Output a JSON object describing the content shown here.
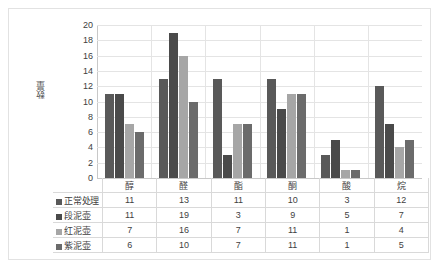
{
  "chart_data": {
    "type": "bar",
    "title": "",
    "xlabel": "",
    "ylabel": "数量",
    "ylim": [
      0,
      20
    ],
    "ytick_step": 2,
    "yticks": [
      20,
      18,
      16,
      14,
      12,
      10,
      8,
      6,
      4,
      2,
      0
    ],
    "grid": true,
    "legend_position": "table-left",
    "categories": [
      "醇",
      "醛",
      "酯",
      "酮",
      "酸",
      "烷"
    ],
    "series": [
      {
        "name": "正常处理",
        "color": "#595959",
        "values": [
          11,
          13,
          11,
          10,
          3,
          12
        ],
        "plotted_values": [
          11,
          13,
          13,
          13,
          3,
          12
        ]
      },
      {
        "name": "段泥壶",
        "color": "#4a4a4a",
        "values": [
          11,
          19,
          3,
          9,
          5,
          7
        ],
        "plotted_values": [
          11,
          19,
          3,
          9,
          5,
          7
        ]
      },
      {
        "name": "红泥壶",
        "color": "#a6a6a6",
        "values": [
          7,
          16,
          7,
          11,
          1,
          4
        ],
        "plotted_values": [
          7,
          16,
          7,
          11,
          1,
          4
        ]
      },
      {
        "name": "紫泥壶",
        "color": "#6b6b6b",
        "values": [
          6,
          10,
          7,
          11,
          1,
          5
        ],
        "plotted_values": [
          6,
          10,
          7,
          11,
          1,
          5
        ]
      }
    ]
  },
  "table": {
    "corner": "",
    "column_headers": [
      "醇",
      "醛",
      "酯",
      "酮",
      "酸",
      "烷"
    ],
    "rows": [
      {
        "label": "正常处理",
        "swatch": "#595959",
        "cells": [
          "11",
          "13",
          "11",
          "10",
          "3",
          "12"
        ]
      },
      {
        "label": "段泥壶",
        "swatch": "#4a4a4a",
        "cells": [
          "11",
          "19",
          "3",
          "9",
          "5",
          "7"
        ]
      },
      {
        "label": "红泥壶",
        "swatch": "#a6a6a6",
        "cells": [
          "7",
          "16",
          "7",
          "11",
          "1",
          "4"
        ]
      },
      {
        "label": "紫泥壶",
        "swatch": "#6b6b6b",
        "cells": [
          "6",
          "10",
          "7",
          "11",
          "1",
          "5"
        ]
      }
    ]
  },
  "colors": {
    "frame_border": "#e2e2e2",
    "gridline": "#e4e4e4",
    "axis": "#c8c8c8",
    "table_border": "#d9d9d9",
    "text": "#3f3f3f"
  }
}
